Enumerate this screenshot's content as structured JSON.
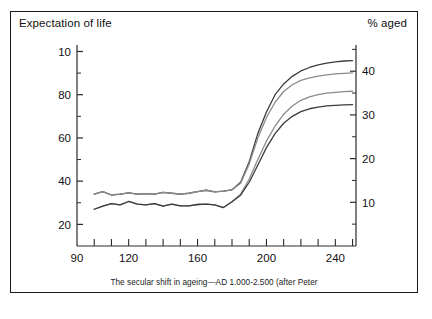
{
  "figure": {
    "left_axis_title": "Expectation of life",
    "right_axis_title": "% aged",
    "caption": "The secular shift in ageing—AD 1.000-2.500 (after Peter"
  },
  "chart_data": {
    "type": "line",
    "title": "The secular shift in ageing—AD 1.000-2.500 (after Peter",
    "xlabel": "",
    "ylabel": "Expectation of life",
    "y2label": "% aged",
    "xlim": [
      90,
      252
    ],
    "ylim": [
      10,
      103
    ],
    "y2lim": [
      0,
      46
    ],
    "grid": false,
    "legend": "none",
    "x_ticks_major": [
      90,
      120,
      160,
      200,
      240
    ],
    "x_tick_labels": [
      "90",
      "120",
      "160",
      "200",
      "240"
    ],
    "x_ticks_minor_step": 10,
    "y_ticks_left": [
      20,
      40,
      60,
      80,
      100
    ],
    "y_tick_labels_left": [
      "20",
      "40",
      "60",
      "80",
      "10"
    ],
    "y_ticks_left_minor": [
      30,
      50,
      70,
      90
    ],
    "y_ticks_right": [
      10,
      20,
      30,
      40
    ],
    "y_tick_labels_right": [
      "10",
      "20",
      "30",
      "40"
    ],
    "y_ticks_right_minor": [
      5,
      15,
      25,
      35,
      45
    ],
    "x": [
      100,
      105,
      110,
      115,
      120,
      125,
      130,
      135,
      140,
      145,
      150,
      155,
      160,
      165,
      170,
      175,
      180,
      185,
      190,
      195,
      200,
      205,
      210,
      215,
      220,
      225,
      230,
      235,
      240,
      245,
      250
    ],
    "series": [
      {
        "name": "curve-1-top",
        "color": "#3c3c3c",
        "values": [
          34.0,
          35.2,
          33.6,
          34.0,
          34.6,
          34.0,
          34.2,
          34.0,
          34.8,
          34.4,
          34.0,
          34.4,
          35.2,
          35.8,
          35.0,
          35.4,
          36.0,
          39.5,
          49.0,
          62.0,
          72.0,
          80.0,
          85.0,
          88.5,
          91.0,
          92.6,
          93.8,
          94.6,
          95.2,
          95.6,
          95.8
        ]
      },
      {
        "name": "curve-2",
        "color": "#8c8c8c",
        "values": [
          34.0,
          35.2,
          33.6,
          34.0,
          34.6,
          34.0,
          34.2,
          34.0,
          34.8,
          34.4,
          34.0,
          34.4,
          35.2,
          35.8,
          35.0,
          35.4,
          36.0,
          39.0,
          48.0,
          60.0,
          69.5,
          76.5,
          81.5,
          84.6,
          86.6,
          87.8,
          88.6,
          89.2,
          89.6,
          89.9,
          90.1
        ]
      },
      {
        "name": "curve-3",
        "color": "#8c8c8c",
        "values": [
          27.0,
          28.4,
          29.6,
          29.0,
          30.6,
          29.4,
          29.0,
          29.6,
          28.4,
          29.4,
          28.6,
          28.6,
          29.2,
          29.4,
          29.0,
          27.8,
          30.5,
          34.0,
          41.0,
          50.0,
          58.5,
          65.5,
          71.0,
          74.8,
          77.4,
          79.0,
          80.0,
          80.7,
          81.1,
          81.4,
          81.6
        ]
      },
      {
        "name": "curve-4-bottom",
        "color": "#3c3c3c",
        "values": [
          27.0,
          28.4,
          29.6,
          29.0,
          30.6,
          29.4,
          29.0,
          29.6,
          28.4,
          29.4,
          28.6,
          28.6,
          29.2,
          29.4,
          29.0,
          27.8,
          30.5,
          33.5,
          39.5,
          47.5,
          55.5,
          62.0,
          66.8,
          70.0,
          72.2,
          73.5,
          74.3,
          74.8,
          75.1,
          75.3,
          75.4
        ]
      }
    ]
  }
}
